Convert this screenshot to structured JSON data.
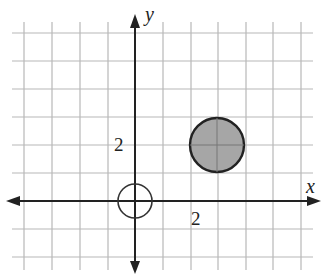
{
  "diagram": {
    "type": "coordinate-plane",
    "x_axis_label": "x",
    "y_axis_label": "y",
    "tick_labels": {
      "x": "2",
      "y": "2"
    },
    "grid": {
      "x_range": [
        -4,
        6
      ],
      "y_range": [
        -2,
        6
      ],
      "unit_px": 27.6
    },
    "shapes": [
      {
        "name": "open-circle",
        "center": [
          0,
          0
        ],
        "radius_units": 0.6,
        "fill": "none",
        "stroke": "#333333"
      },
      {
        "name": "filled-circle",
        "center": [
          3,
          2
        ],
        "radius_units": 1.0,
        "fill": "#a6a6a6",
        "stroke": "#222222"
      }
    ],
    "colors": {
      "grid": "#b8b8b8",
      "axis": "#222222",
      "fill": "#a6a6a6"
    }
  }
}
